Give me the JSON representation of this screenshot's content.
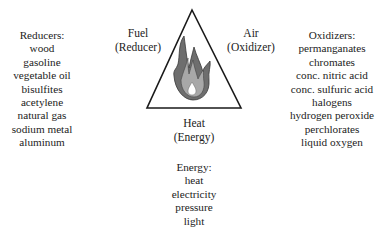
{
  "triangle": {
    "left_label": {
      "line1": "Fuel",
      "line2": "(Reducer)"
    },
    "right_label": {
      "line1": "Air",
      "line2": "(Oxidizer)"
    },
    "bottom_label": {
      "line1": "Heat",
      "line2": "(Energy)"
    },
    "icon": "flame-icon",
    "colors": {
      "outline": "#1a1a1a",
      "flame_outer": "#6e6e6e",
      "flame_inner": "#a8a8a8",
      "flame_core": "#ffffff"
    }
  },
  "reducers": {
    "title": "Reducers:",
    "items": [
      "wood",
      "gasoline",
      "vegetable oil",
      "bisulfites",
      "acetylene",
      "natural gas",
      "sodium metal",
      "aluminum"
    ]
  },
  "oxidizers": {
    "title": "Oxidizers:",
    "items": [
      "permanganates",
      "chromates",
      "conc. nitric acid",
      "conc. sulfuric acid",
      "halogens",
      "hydrogen peroxide",
      "perchlorates",
      "liquid oxygen"
    ]
  },
  "energy": {
    "title": "Energy:",
    "items": [
      "heat",
      "electricity",
      "pressure",
      "light"
    ]
  }
}
